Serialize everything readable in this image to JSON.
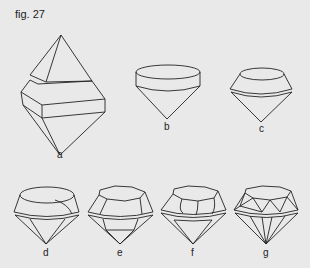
{
  "figure": {
    "title": "fig. 27",
    "background": "#e9e9e9",
    "line_color": "#222222",
    "items": [
      {
        "label": "a",
        "description": "octahedron crystal split into point cut"
      },
      {
        "label": "b",
        "description": "cylindrical table with conical pavilion"
      },
      {
        "label": "c",
        "description": "tapered crown with girdle and cone pavilion"
      },
      {
        "label": "d",
        "description": "rounded crown with girdle facets"
      },
      {
        "label": "e",
        "description": "faceted crown and pavilion"
      },
      {
        "label": "f",
        "description": "more facets on crown and pavilion"
      },
      {
        "label": "g",
        "description": "full brilliant cut"
      }
    ]
  }
}
